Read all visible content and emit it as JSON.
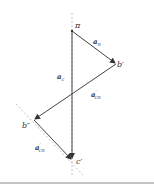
{
  "diagram": {
    "type": "vector-polygon",
    "points": {
      "a": {
        "label": "π",
        "x": 72,
        "y": 31
      },
      "b1": {
        "label": "b′",
        "x": 116,
        "y": 64
      },
      "b2": {
        "label": "b″",
        "x": 34,
        "y": 120
      },
      "c1": {
        "label": "c′",
        "x": 72,
        "y": 160
      }
    },
    "vectors": [
      {
        "id": "a_n",
        "label": "a",
        "sub": "n",
        "prime": "",
        "from": "a",
        "to": "b1"
      },
      {
        "id": "a_c",
        "label": "a",
        "sub": "c",
        "prime": "",
        "from": "a",
        "to": "c1"
      },
      {
        "id": "a_cn_1",
        "label": "a",
        "sub": "cn",
        "prime": "′",
        "from": "b1",
        "to": "b2"
      },
      {
        "id": "a_cn_2",
        "label": "a",
        "sub": "cn",
        "prime": "′",
        "from": "b2",
        "to": "c1"
      }
    ],
    "colors": {
      "line": "#444444",
      "dashed": "#999999",
      "baseline": "#888888"
    }
  }
}
